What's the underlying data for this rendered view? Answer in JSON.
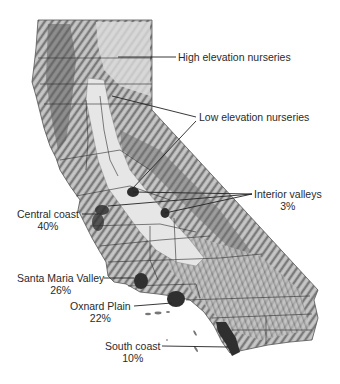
{
  "map": {
    "subject": "California strawberry nursery and production regions",
    "colors": {
      "terrain_dark": "#6a6a6a",
      "terrain_mid": "#a8a8a8",
      "valley_light": "#e4e4e4",
      "region_dark": "#3a3a3a",
      "lines": "#333333",
      "background": "#ffffff"
    }
  },
  "labels": {
    "high_elevation": {
      "name": "High elevation nurseries"
    },
    "low_elevation": {
      "name": "Low elevation nurseries"
    },
    "interior_valleys": {
      "name": "Interior valleys",
      "pct": "3%"
    },
    "central_coast": {
      "name": "Central coast",
      "pct": "40%"
    },
    "santa_maria": {
      "name": "Santa Maria Valley",
      "pct": "26%"
    },
    "oxnard": {
      "name": "Oxnard Plain",
      "pct": "22%"
    },
    "south_coast": {
      "name": "South coast",
      "pct": "10%"
    }
  }
}
